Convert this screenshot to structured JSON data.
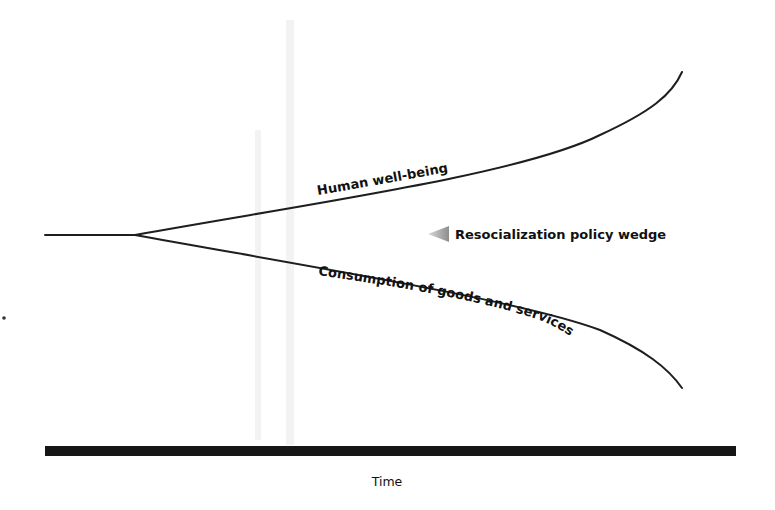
{
  "diagram": {
    "title": "",
    "labels": {
      "upper_curve": "Human well-being",
      "lower_curve": "Consumption of goods and services",
      "wedge_annotation": "Resocialization policy wedge",
      "x_axis": "Time"
    },
    "icons": {
      "wedge_arrow": "left-arrow-triangle"
    },
    "colors": {
      "line": "#1e1e1e",
      "axis": "#161616",
      "arrow": "#9a9a9a",
      "background": "#ffffff"
    },
    "structure": {
      "baseline_start": [
        45,
        235
      ],
      "divergence_point": [
        135,
        235
      ],
      "upper_curve_end": [
        682,
        72
      ],
      "lower_curve_end": [
        682,
        388
      ],
      "time_axis_y": 451
    }
  }
}
